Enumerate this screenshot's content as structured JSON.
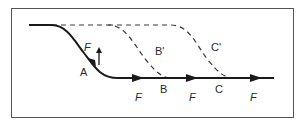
{
  "diagram": {
    "type": "flow-path-diagram",
    "colors": {
      "stroke": "#1a1a1a",
      "dashed": "#3a3a3a",
      "frame": "#555555",
      "background": "#ffffff"
    },
    "paths": [
      {
        "id": "solid-path",
        "style": "solid",
        "description": "upper level descending through A to lower level, continuing through B and C with arrows"
      },
      {
        "id": "dashed-B-prime",
        "style": "dashed",
        "description": "alternate path descending at B' to B"
      },
      {
        "id": "dashed-C-prime",
        "style": "dashed",
        "description": "alternate path descending at C' to C"
      }
    ],
    "labels": {
      "a": "A",
      "b": "B",
      "c": "C",
      "b_prime": "B'",
      "c_prime": "C'",
      "force_a": "F",
      "force_1": "F",
      "force_2": "F",
      "force_3": "F"
    }
  }
}
